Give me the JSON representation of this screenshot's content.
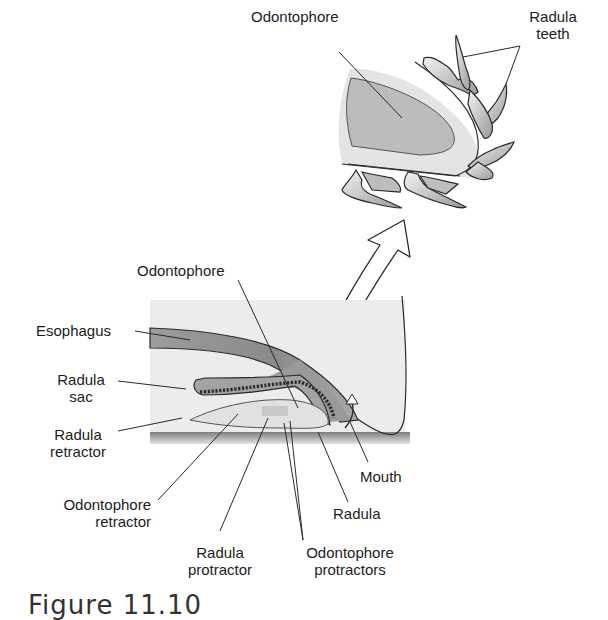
{
  "figure": {
    "caption": "Figure 11.10"
  },
  "detail_view": {
    "labels": {
      "odontophore": "Odontophore",
      "radula_teeth_line1": "Radula",
      "radula_teeth_line2": "teeth"
    }
  },
  "section_view": {
    "labels": {
      "odontophore": "Odontophore",
      "esophagus": "Esophagus",
      "radula_sac_line1": "Radula",
      "radula_sac_line2": "sac",
      "radula_retractor_line1": "Radula",
      "radula_retractor_line2": "retractor",
      "odontophore_retractor_line1": "Odontophore",
      "odontophore_retractor_line2": "retractor",
      "radula_protractor_line1": "Radula",
      "radula_protractor_line2": "protractor",
      "odontophore_protractors_line1": "Odontophore",
      "odontophore_protractors_line2": "protractors",
      "radula": "Radula",
      "mouth": "Mouth"
    }
  },
  "colors": {
    "line": "#2a2a2a",
    "tissue_dark": "#8a8a8a",
    "tissue_mid": "#b5b5b5",
    "tissue_light": "#dcdcdc",
    "background_panel": "#ececec",
    "substrate": "#9a9a9a"
  }
}
